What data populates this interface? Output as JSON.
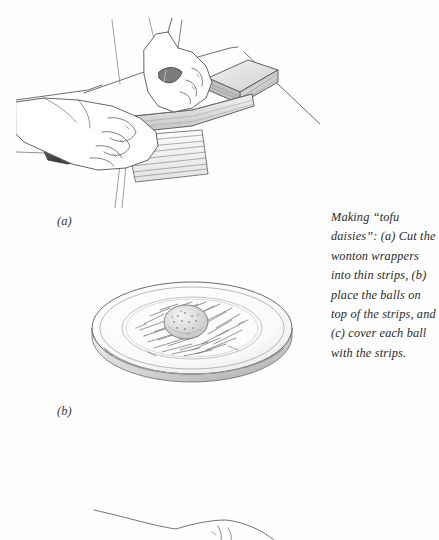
{
  "page": {
    "background_color": "#fefefe",
    "ink_color": "#3a3a3a",
    "text_color": "#2b2b2b",
    "width": 439,
    "height": 540
  },
  "caption": {
    "text": "Making “tofu daisies”: (a) Cut the wonton wrappers into thin strips, (b) place the balls on top of the strips, and (c) cover each ball with the strips.",
    "lines": [
      "Making “tofu daisies”:",
      "(a) Cut the wonton",
      "wrappers into thin",
      "strips, (b) place the",
      "balls on top of the",
      "strips, and (c) cover",
      "each ball with the",
      "strips."
    ],
    "style": "italic-serif"
  },
  "panels": [
    {
      "id": "a",
      "label": "(a)",
      "title": "Hands cutting wonton wrappers into thin strips with a knife on a cutting board",
      "elements": [
        "left-hand-holding-knife-handle",
        "right-hand-guiding-blade",
        "chef-knife-blade",
        "dark-knife-handle",
        "stack-of-wonton-wrappers",
        "cut-strips",
        "cutting-board-edge"
      ]
    },
    {
      "id": "b",
      "label": "(b)",
      "title": "Plate with a tofu ball resting on a nest of wonton strips",
      "elements": [
        "round-plate",
        "plate-rim",
        "nest-of-strips",
        "speckled-tofu-ball"
      ]
    },
    {
      "id": "c",
      "label": "",
      "title": "Partial hand outline at the bottom edge of the page (cropped start of panel c)",
      "elements": [
        "partial-hand-outline"
      ]
    }
  ]
}
